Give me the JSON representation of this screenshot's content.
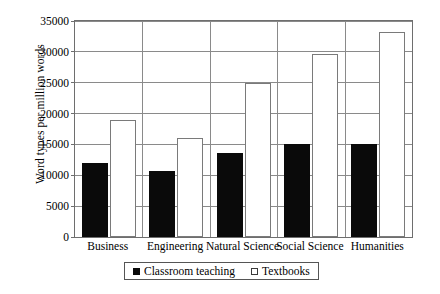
{
  "chart_data": {
    "type": "bar",
    "title": "",
    "xlabel": "",
    "ylabel": "Word types per million words",
    "ylim": [
      0,
      35000
    ],
    "ytick_step": 5000,
    "yticks": [
      "0",
      "5000",
      "10000",
      "15000",
      "20000",
      "25000",
      "30000",
      "35000"
    ],
    "ytick_values": [
      0,
      5000,
      10000,
      15000,
      20000,
      25000,
      30000,
      35000
    ],
    "grid": true,
    "legend_position": "bottom",
    "categories": [
      "Business",
      "Engineering",
      "Natural Science",
      "Social Science",
      "Humanities"
    ],
    "series": [
      {
        "name": "Classroom teaching",
        "color": "#0a0a0a",
        "style": "filled",
        "values": [
          12000,
          10700,
          13600,
          15000,
          15000
        ]
      },
      {
        "name": "Textbooks",
        "color": "#ffffff",
        "style": "outlined",
        "values": [
          19000,
          16000,
          25000,
          29700,
          33300
        ]
      }
    ]
  },
  "legend": {
    "entries": [
      {
        "label": "Classroom teaching",
        "swatch": "filled-square"
      },
      {
        "label": "Textbooks",
        "swatch": "open-square"
      }
    ]
  },
  "axes": {
    "y_title": "Word types per million words"
  },
  "colors": {
    "series_dark": "#0a0a0a",
    "series_light": "#ffffff",
    "grid": "#8a8a8a",
    "frame": "#6e6e6e",
    "text": "#000000"
  }
}
